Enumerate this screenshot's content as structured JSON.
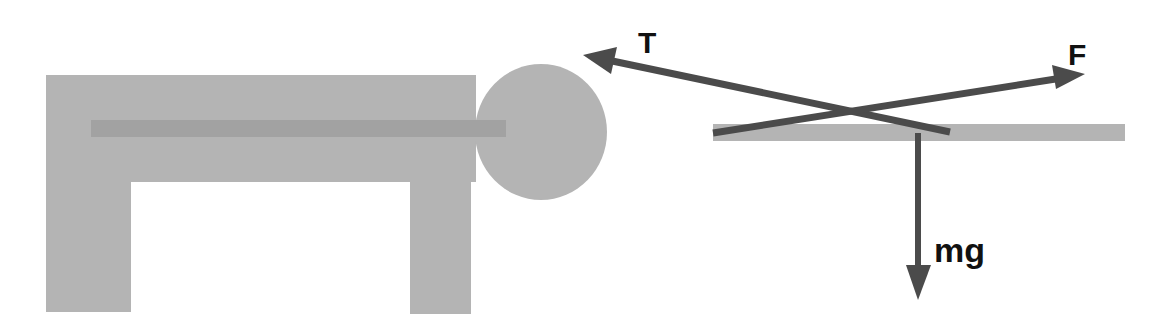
{
  "diagram": {
    "colors": {
      "background": "#ffffff",
      "table": "#b4b4b4",
      "rod": "#a2a2a2",
      "ball": "#b4b4b4",
      "platform": "#b4b4b4",
      "arrow": "#4b4b4b",
      "label": "#111111"
    },
    "forces": [
      {
        "id": "tension",
        "label": "T",
        "direction": "up-left"
      },
      {
        "id": "applied",
        "label": "F",
        "direction": "up-right"
      },
      {
        "id": "weight",
        "label": "mg",
        "direction": "down"
      }
    ]
  }
}
